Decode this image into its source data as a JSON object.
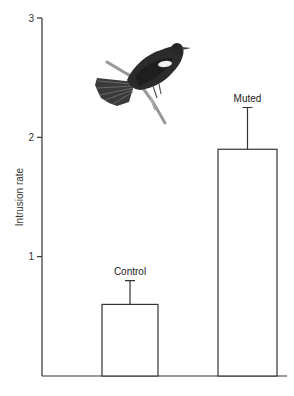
{
  "chart_data": {
    "type": "bar",
    "title": "",
    "xlabel": "",
    "ylabel": "Intrusion rate",
    "ylim": [
      0,
      3
    ],
    "yticks": [
      1,
      2,
      3
    ],
    "categories": [
      "Control",
      "Muted"
    ],
    "values": [
      0.6,
      1.9
    ],
    "error_upper": [
      0.8,
      2.25
    ],
    "bar_fill": "#ffffff",
    "bar_stroke": "#333333",
    "grid": false,
    "legend": null,
    "annotations": [
      "Illustration of a red-winged blackbird perched on a branch (upper-left of plot area)"
    ]
  },
  "illustration": {
    "name": "red-winged-blackbird"
  }
}
